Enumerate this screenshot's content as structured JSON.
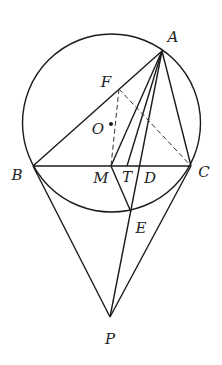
{
  "diagram": {
    "type": "geometry",
    "stroke_color": "#1a1a1a",
    "circle": {
      "center": "O",
      "cx": 111.5,
      "cy": 123,
      "r": 89
    },
    "points": {
      "A": {
        "x": 162,
        "y": 51,
        "label": "A",
        "lx": 173,
        "ly": 42
      },
      "B": {
        "x": 33,
        "y": 166,
        "label": "B",
        "lx": 17,
        "ly": 180
      },
      "C": {
        "x": 191,
        "y": 166,
        "label": "C",
        "lx": 204,
        "ly": 177
      },
      "M": {
        "x": 111,
        "y": 166,
        "label": "M",
        "lx": 101,
        "ly": 183
      },
      "T": {
        "x": 127,
        "y": 166,
        "label": "T",
        "lx": 127,
        "ly": 182
      },
      "D": {
        "x": 139,
        "y": 166,
        "label": "D",
        "lx": 150,
        "ly": 183
      },
      "E": {
        "x": 131,
        "y": 212,
        "label": "E",
        "lx": 141,
        "ly": 233
      },
      "F": {
        "x": 119,
        "y": 89,
        "label": "F",
        "lx": 106,
        "ly": 87
      },
      "O": {
        "x": 111,
        "y": 124,
        "label": "O",
        "lx": 98,
        "ly": 134
      },
      "P": {
        "x": 110,
        "y": 317,
        "label": "P",
        "lx": 110,
        "ly": 344
      }
    },
    "solid_segments": [
      [
        "A",
        "B"
      ],
      [
        "A",
        "C"
      ],
      [
        "B",
        "C"
      ],
      [
        "A",
        "M"
      ],
      [
        "A",
        "T"
      ],
      [
        "A",
        "P"
      ],
      [
        "M",
        "E"
      ],
      [
        "B",
        "P"
      ],
      [
        "C",
        "P"
      ]
    ],
    "dashed_segments": [
      [
        "F",
        "M"
      ],
      [
        "F",
        "C"
      ]
    ],
    "labels": [
      "A",
      "B",
      "C",
      "M",
      "T",
      "D",
      "E",
      "F",
      "O",
      "P"
    ]
  }
}
